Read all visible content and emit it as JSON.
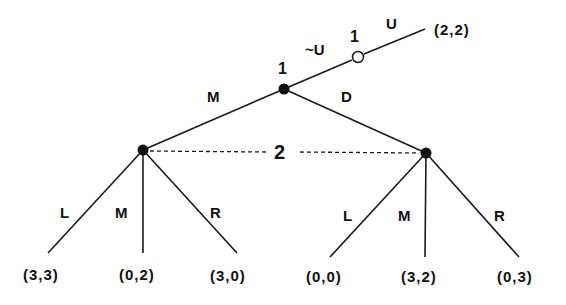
{
  "diagram": {
    "type": "extensive-form game tree",
    "colors": {
      "ink": "#1a1a1a",
      "background": "#ffffff"
    },
    "nodes": {
      "root": {
        "player": "1",
        "x": 284,
        "y": 89,
        "style": "filled"
      },
      "outside_option": {
        "player": "1",
        "x": 358,
        "y": 57,
        "style": "hollow"
      },
      "left_p2": {
        "x": 143,
        "y": 150,
        "style": "filled"
      },
      "right_p2": {
        "x": 426,
        "y": 153,
        "style": "filled"
      }
    },
    "information_set": {
      "player": "2",
      "label": "2"
    },
    "actions": {
      "not_u": "~U",
      "u": "U",
      "m": "M",
      "d": "D",
      "left_l": "L",
      "left_m": "M",
      "left_r": "R",
      "right_l": "L",
      "right_m": "M",
      "right_r": "R"
    },
    "player_labels": {
      "root": "1",
      "outside_option": "1"
    },
    "payoffs": {
      "u": "(2,2)",
      "ml": "(3,3)",
      "mm": "(0,2)",
      "mr": "(3,0)",
      "dl": "(0,0)",
      "dm": "(3,2)",
      "dr": "(0,3)"
    }
  }
}
